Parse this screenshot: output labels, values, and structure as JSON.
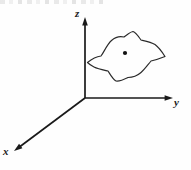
{
  "figure": {
    "background_color": "#fefefe",
    "line_color": "#1a1a1a",
    "width": 191,
    "height": 170
  },
  "axes": [
    {
      "id": "z",
      "label": "z",
      "direction": "up",
      "origin": [
        85,
        98
      ],
      "tip": [
        85,
        17
      ],
      "arrowhead": true
    },
    {
      "id": "y",
      "label": "y",
      "direction": "right",
      "origin": [
        85,
        98
      ],
      "tip": [
        173,
        98
      ],
      "arrowhead": true
    },
    {
      "id": "x",
      "label": "x",
      "direction": "lower-left",
      "origin": [
        85,
        98
      ],
      "tip": [
        14,
        151
      ],
      "arrowhead": true
    }
  ],
  "blob": {
    "name": "closed-surface-patch",
    "stroke_color": "#2a2a2a",
    "extent": {
      "left": 87,
      "right": 165,
      "top": 31,
      "bottom": 81
    },
    "outline_path": "M 87.5 62.5 C 93 58 97 56.5 101 56 C 104 52 107 44.5 111.5 40.5 C 116 36.5 120 36 124 37 C 127.5 34.5 130 32 133 31.5 C 136 32.5 138.5 36.5 141 40 C 145.5 41 151 42 155 44.5 C 158.5 47 161.5 51 165 56.5 C 160 58.5 155.5 60 151 61 C 148 64.5 145 69 141 72.5 C 137 76 132.5 77.5 128 77.5 C 124 79.5 119 81.5 116 81 C 113 79.5 110.5 75 108 71 C 103.5 70 98 69 94 67 C 91 65.5 89 64 87.5 62.5 Z",
    "center_point": {
      "name": "marked-point",
      "coords": [
        125,
        53
      ],
      "radius": 2.1,
      "color": "#111111"
    }
  },
  "labels": {
    "z": "z",
    "y": "y",
    "x": "x"
  },
  "artifact": {
    "name": "scan-edge-artifact",
    "description": "faint cropped text remnant along the top edge"
  }
}
